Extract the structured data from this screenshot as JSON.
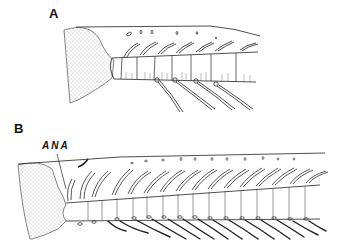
{
  "figure": {
    "panels": [
      {
        "id": "A",
        "label": "A",
        "description": "Lateral view of appendage with stippled base and short segmented axis bearing dorsal hooked setae and ventral long setae"
      },
      {
        "id": "B",
        "label": "B",
        "description": "Lateral view of longer appendage with stippled base, many segments bearing dorsal curved setae and ventral long setae",
        "annotations": [
          {
            "text": "ANA"
          }
        ]
      }
    ]
  },
  "colors": {
    "line": "#222222",
    "stipple": "#555555",
    "background": "#ffffff"
  }
}
